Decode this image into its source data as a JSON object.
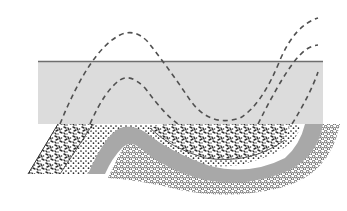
{
  "diagram": {
    "title": "Angular unconformity with eroded fold",
    "colors": {
      "background": "#ffffff",
      "overlying_layer": "#dcdcdc",
      "overlying_top_line": "#6e6e6e",
      "dashed_line": "#505050",
      "middle_band": "#a8a8a8",
      "stipple": "#2e2e2e"
    },
    "layers": [
      {
        "id": "overlying-layer",
        "description": "horizontal light gray layer",
        "bbox": [
          38,
          61,
          323,
          124
        ]
      },
      {
        "id": "coarse-stipple-layer",
        "description": "coarse speckled tilted bed"
      },
      {
        "id": "fine-stipple-layer",
        "description": "fine dotted bed"
      },
      {
        "id": "gray-fold-band",
        "description": "folded solid gray bed"
      },
      {
        "id": "pebble-layer",
        "description": "circle-pattern conglomerate bed"
      }
    ],
    "dashed_lines": [
      {
        "id": "outer-projected-fold",
        "description": "eroded fold projection (outer)"
      },
      {
        "id": "inner-projected-fold",
        "description": "eroded fold projection (inner)"
      }
    ]
  }
}
